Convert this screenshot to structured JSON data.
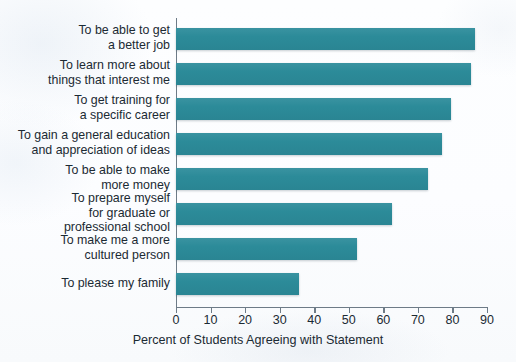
{
  "chart_data": {
    "type": "bar",
    "orientation": "horizontal",
    "title": "",
    "xlabel": "Percent of Students Agreeing with Statement",
    "ylabel": "",
    "xlim": [
      0,
      90
    ],
    "xticks": [
      0,
      10,
      20,
      30,
      40,
      50,
      60,
      70,
      80,
      90
    ],
    "grid": false,
    "legend": false,
    "bar_color": "#2c8b99",
    "categories": [
      "To be able to get\na better job",
      "To learn more about\nthings that interest me",
      "To get training for\na specific career",
      "To gain a general education\nand appreciation of ideas",
      "To be able to make\nmore money",
      "To prepare myself\nfor graduate or\nprofessional school",
      "To make me a more\ncultured person",
      "To please my family"
    ],
    "values": [
      86.5,
      85.5,
      79.5,
      77,
      73,
      62.5,
      52.5,
      35.5
    ]
  },
  "axis": {
    "tick_labels": [
      "0",
      "10",
      "20",
      "30",
      "40",
      "50",
      "60",
      "70",
      "80",
      "90"
    ],
    "x_title": "Percent of Students Agreeing with Statement"
  }
}
